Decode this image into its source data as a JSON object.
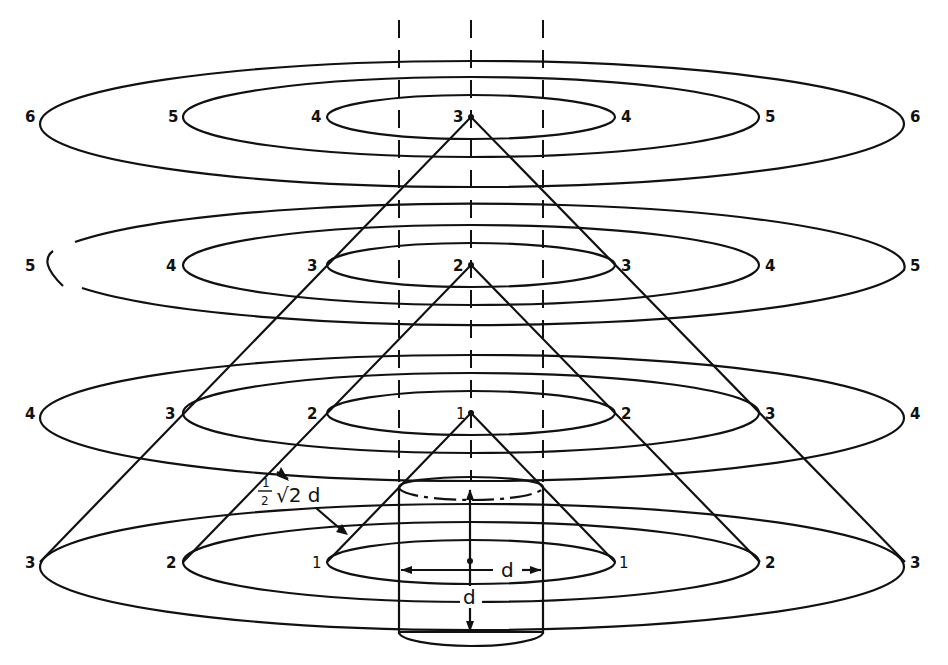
{
  "figure": {
    "levels": [
      {
        "name": "level-1",
        "apex_label": "3",
        "ring_labels": [
          "4",
          "5",
          "6"
        ]
      },
      {
        "name": "level-2",
        "apex_label": "2",
        "ring_labels": [
          "3",
          "4",
          "5"
        ]
      },
      {
        "name": "level-3",
        "apex_label": "1",
        "ring_labels": [
          "2",
          "3",
          "4"
        ]
      },
      {
        "name": "level-4",
        "apex_label": "",
        "ring_labels": [
          "1",
          "2",
          "3"
        ]
      }
    ],
    "annotations": {
      "slant_label_num": "1",
      "slant_label_den": "2",
      "slant_label_rest": "√2 d",
      "diameter_label": "d",
      "height_label": "d"
    }
  },
  "labels": {
    "l1": {
      "left6": "6",
      "left5": "5",
      "left4": "4",
      "apex": "3",
      "right4": "4",
      "right5": "5",
      "right6": "6"
    },
    "l2": {
      "left5": "5",
      "left4": "4",
      "left3": "3",
      "apex": "2",
      "right3": "3",
      "right4": "4",
      "right5": "5"
    },
    "l3": {
      "left4": "4",
      "left3": "3",
      "left2": "2",
      "apex": "1",
      "right2": "2",
      "right3": "3",
      "right4": "4"
    },
    "l4": {
      "left3": "3",
      "left2": "2",
      "left1": "1",
      "right1": "1",
      "right2": "2",
      "right3": "3"
    }
  },
  "colors": {
    "ink": "#111111",
    "paper": "#ffffff"
  }
}
